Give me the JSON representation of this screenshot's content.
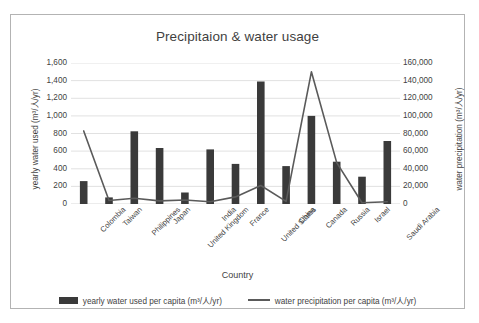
{
  "chart_data": {
    "type": "bar",
    "title": "Precipitaion & water usage",
    "xlabel": "Country",
    "ylabel": "yearly water used  (m³/人/yr)",
    "y2label": "water precipitation  (m³/人/yr)",
    "categories": [
      "Colombia",
      "Taiwan",
      "Philippines",
      "Japan",
      "United Kingdom",
      "India",
      "France",
      "United States",
      "China",
      "Canada",
      "Russia",
      "Israel",
      "Saudi Arabia"
    ],
    "series": [
      {
        "name": "yearly water used per capita (m³/人/yr)",
        "type": "bar",
        "axis": "left",
        "color": "#3a3a3a",
        "values": [
          260,
          75,
          825,
          635,
          130,
          620,
          455,
          1390,
          430,
          1000,
          480,
          310,
          715
        ]
      },
      {
        "name": "water precipitation per capita (m³/人/yr)",
        "type": "line",
        "axis": "right",
        "color": "#5a5a5a",
        "values": [
          83000,
          4000,
          6500,
          3500,
          4500,
          2500,
          8000,
          21000,
          3000,
          150000,
          47000,
          1500,
          2500
        ]
      }
    ],
    "ylim": [
      0,
      1600
    ],
    "ytick_step": 200,
    "yticks": [
      "0",
      "200",
      "400",
      "600",
      "800",
      "1,000",
      "1,200",
      "1,400",
      "1,600"
    ],
    "y2lim": [
      0,
      160000
    ],
    "y2tick_step": 20000,
    "y2ticks": [
      "0",
      "20,000",
      "40,000",
      "60,000",
      "80,000",
      "100,000",
      "120,000",
      "140,000",
      "160,000"
    ],
    "grid": true,
    "gridline_color": "#d9d9d9",
    "legend_position": "bottom",
    "plot_background": "#ffffff",
    "frame_border_color": "#b3b3b3"
  }
}
